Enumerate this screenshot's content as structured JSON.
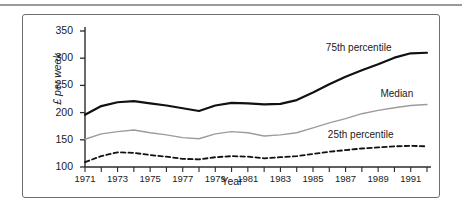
{
  "figure": {
    "frame_border_color": "#6e6e6e",
    "background": "#ffffff",
    "top_rule_color": "#9a9a9a"
  },
  "axes": {
    "ylabel": "£ per week",
    "xlabel": "Year",
    "yticks": [
      "350",
      "300",
      "250",
      "200",
      "150",
      "100"
    ],
    "xticks": [
      "1971",
      "1973",
      "1975",
      "1977",
      "1979",
      "1981",
      "1983",
      "1985",
      "1987",
      "1989",
      "1991"
    ]
  },
  "series_labels": {
    "p75": "75th percentile",
    "median": "Median",
    "p25": "25th percentile"
  },
  "colors": {
    "p75": "#111111",
    "median": "#9c9c9c",
    "p25": "#111111",
    "axis": "#2b2b2b"
  },
  "chart_data": {
    "type": "line",
    "title": "",
    "xlabel": "Year",
    "ylabel": "£ per week",
    "xlim": [
      1971,
      1992
    ],
    "ylim": [
      100,
      350
    ],
    "grid": false,
    "legend": "inline-right-annotations",
    "x": [
      1971,
      1972,
      1973,
      1974,
      1975,
      1976,
      1977,
      1978,
      1979,
      1980,
      1981,
      1982,
      1983,
      1984,
      1985,
      1986,
      1987,
      1988,
      1989,
      1990,
      1991,
      1992
    ],
    "series": [
      {
        "name": "75th percentile",
        "style": "solid-thick",
        "color": "#111111",
        "values": [
          196,
          212,
          219,
          221,
          217,
          213,
          208,
          203,
          213,
          218,
          217,
          215,
          216,
          223,
          237,
          252,
          266,
          278,
          289,
          301,
          309,
          310
        ]
      },
      {
        "name": "Median",
        "style": "solid-thin",
        "color": "#9c9c9c",
        "values": [
          151,
          161,
          165,
          168,
          163,
          159,
          154,
          152,
          161,
          165,
          163,
          157,
          159,
          163,
          172,
          181,
          189,
          198,
          204,
          209,
          213,
          215
        ]
      },
      {
        "name": "25th percentile",
        "style": "dashed",
        "color": "#111111",
        "values": [
          109,
          120,
          127,
          126,
          122,
          119,
          115,
          114,
          118,
          120,
          119,
          116,
          118,
          120,
          124,
          128,
          131,
          134,
          136,
          138,
          139,
          138
        ]
      }
    ]
  }
}
